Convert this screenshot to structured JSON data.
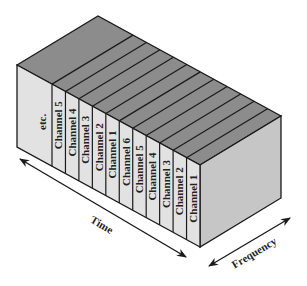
{
  "diagram": {
    "type": "isometric-block",
    "front_labels": [
      "etc.",
      "Channel 5",
      "Channel 4",
      "Channel 3",
      "Channel 2",
      "Channel 1",
      "Channel 6",
      "Channel 5",
      "Channel 4",
      "Channel 3",
      "Channel 2",
      "Channel 1"
    ],
    "axes": {
      "time_label": "Time",
      "frequency_label": "Frequency"
    },
    "colors": {
      "top_face": "#8c8c8c",
      "front_face": "#e2e2e2",
      "side_face": "#c6c6c6",
      "outline": "#1a1a1a"
    }
  }
}
